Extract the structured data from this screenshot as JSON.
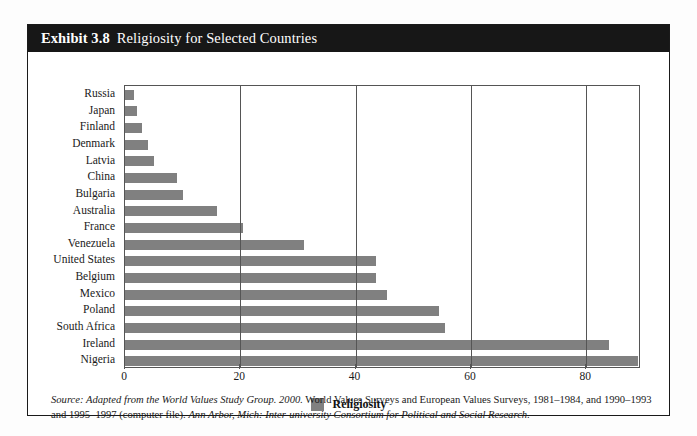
{
  "exhibit": {
    "number": "Exhibit 3.8",
    "title": "Religiosity for Selected Countries"
  },
  "legend": {
    "label": "Religiosity",
    "swatch_color": "#808080"
  },
  "source": {
    "line1_italic_lead": "Source: Adapted from the World Values Study Group. 2000.",
    "line1_rest": " World Values Surveys and European Values Surveys, 1981–1984, and 1990–1993",
    "line2_lead": "and 1995–1997 (computer file). ",
    "line2_italic": "Ann Arbor, Mich: Inter-university Consortium for Political and Social Research."
  },
  "chart_data": {
    "type": "bar",
    "orientation": "horizontal",
    "title": "Religiosity for Selected Countries",
    "xlabel": "",
    "ylabel": "",
    "xlim": [
      0,
      89.5
    ],
    "xticks": [
      0,
      20,
      40,
      60,
      80
    ],
    "grid": true,
    "legend_position": "bottom-center",
    "series": [
      {
        "name": "Religiosity",
        "color": "#808080",
        "values": [
          1.5,
          2,
          3,
          4,
          5,
          9,
          10,
          16,
          20.5,
          31,
          43.5,
          43.5,
          45.5,
          54.5,
          55.5,
          84,
          89
        ]
      }
    ],
    "categories": [
      "Russia",
      "Japan",
      "Finland",
      "Denmark",
      "Latvia",
      "China",
      "Bulgaria",
      "Australia",
      "France",
      "Venezuela",
      "United States",
      "Belgium",
      "Mexico",
      "Poland",
      "South Africa",
      "Ireland",
      "Nigeria"
    ]
  }
}
